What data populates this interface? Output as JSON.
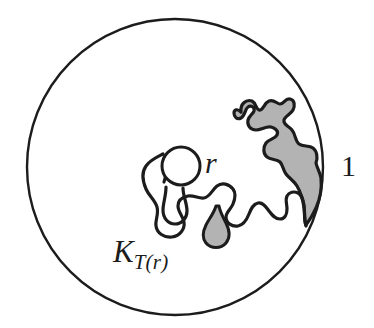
{
  "figure": {
    "kind": "mathematical-diagram",
    "background_color": "#ffffff",
    "stroke_color": "#1c1c1c",
    "fill_gray": "#b3b3b3",
    "labels": {
      "radius_small": "r",
      "radius_unit": "1",
      "hull_base": "K",
      "hull_subscript": "T(r)"
    },
    "unit_circle": {
      "name": "unit-circle",
      "cx": 175,
      "cy": 167,
      "r": 148,
      "stroke_width": 2.4,
      "fill": "none"
    },
    "inner_circle": {
      "name": "inner-circle-radius-r",
      "cx": 181,
      "cy": 166,
      "r": 19,
      "stroke_width": 3.0,
      "fill": "none"
    },
    "hull_outline": {
      "name": "hull-outline",
      "stroke_width": 3.2,
      "fill": "none"
    },
    "shaded_band": {
      "name": "shaded-band",
      "fill": "#b3b3b3",
      "stroke_width": 3.2
    },
    "teardrop": {
      "name": "teardrop-blob",
      "fill": "#b3b3b3",
      "stroke_width": 3.0
    }
  }
}
